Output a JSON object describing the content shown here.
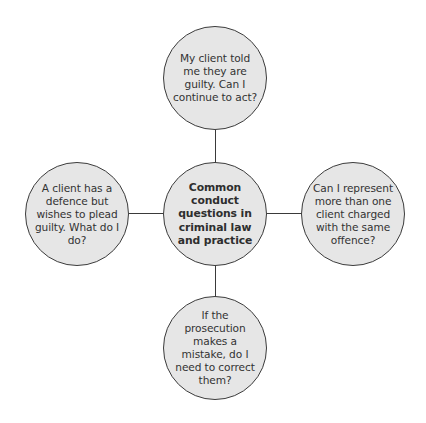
{
  "diagram": {
    "type": "hub-and-spoke",
    "colors": {
      "node_fill": "#e6e6e6",
      "node_border": "#3c3c3c",
      "connector": "#3a3a3a",
      "text": "#333333",
      "background": "#ffffff"
    },
    "center": {
      "label": "Common conduct questions in criminal law and practice"
    },
    "spokes": {
      "top": {
        "label": "My client told me they are guilty. Can I continue to act?"
      },
      "left": {
        "label": "A client has a defence but wishes to plead guilty. What do I do?"
      },
      "right": {
        "label": "Can I represent more than one client charged with the same offence?"
      },
      "bottom": {
        "label": "If the prosecution makes a mistake, do I need to correct them?"
      }
    }
  }
}
